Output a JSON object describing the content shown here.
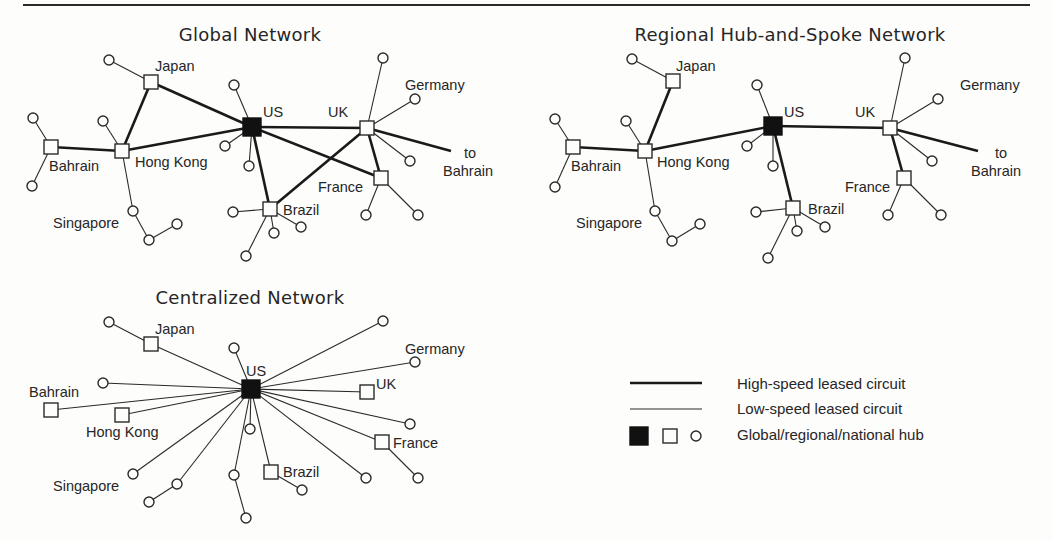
{
  "colors": {
    "ink": "#1a1a1a",
    "paper": "#fdfdfc",
    "global_hub": "#111111"
  },
  "diagrams": [
    {
      "id": "global",
      "title": "Global Network",
      "title_pos": [
        250,
        41
      ],
      "nodes": [
        {
          "id": "us",
          "type": "global",
          "x": 252,
          "y": 127,
          "label": "US",
          "lx": 263,
          "ly": 117
        },
        {
          "id": "japan",
          "type": "regional",
          "x": 151,
          "y": 82,
          "label": "Japan",
          "lx": 155,
          "ly": 71
        },
        {
          "id": "bahrain",
          "type": "regional",
          "x": 51,
          "y": 147,
          "label": "Bahrain",
          "lx": 49,
          "ly": 171
        },
        {
          "id": "hongkong",
          "type": "regional",
          "x": 122,
          "y": 151,
          "label": "Hong Kong",
          "lx": 135,
          "ly": 167
        },
        {
          "id": "uk",
          "type": "regional",
          "x": 367,
          "y": 128,
          "label": "UK",
          "lx": 328,
          "ly": 117
        },
        {
          "id": "france",
          "type": "regional",
          "x": 381,
          "y": 178,
          "label": "France",
          "lx": 318,
          "ly": 192
        },
        {
          "id": "brazil",
          "type": "regional",
          "x": 270,
          "y": 209,
          "label": "Brazil",
          "lx": 283,
          "ly": 215
        },
        {
          "id": "germany_lbl",
          "type": "label",
          "label": "Germany",
          "lx": 405,
          "ly": 90
        },
        {
          "id": "singapore_lbl",
          "type": "label",
          "label": "Singapore",
          "lx": 53,
          "ly": 228
        },
        {
          "id": "tobahrain_lbl",
          "type": "label",
          "label": "to",
          "lx": 464,
          "ly": 158
        },
        {
          "id": "tobahrain_lbl2",
          "type": "label",
          "label": "Bahrain",
          "lx": 443,
          "ly": 176
        }
      ],
      "high_speed": [
        [
          252,
          127,
          151,
          82
        ],
        [
          252,
          127,
          122,
          151
        ],
        [
          151,
          82,
          122,
          151
        ],
        [
          122,
          151,
          51,
          147
        ],
        [
          252,
          127,
          367,
          128
        ],
        [
          252,
          127,
          381,
          178
        ],
        [
          252,
          127,
          270,
          209
        ],
        [
          270,
          209,
          367,
          128
        ],
        [
          367,
          128,
          381,
          178
        ],
        [
          367,
          128,
          451,
          151
        ]
      ],
      "low_speed": [
        [
          151,
          82,
          109,
          60
        ],
        [
          51,
          147,
          33,
          118
        ],
        [
          51,
          147,
          32,
          186
        ],
        [
          122,
          151,
          103,
          121
        ],
        [
          122,
          151,
          133,
          211
        ],
        [
          133,
          211,
          149,
          240
        ],
        [
          149,
          240,
          177,
          224
        ],
        [
          252,
          127,
          234,
          85
        ],
        [
          252,
          127,
          225,
          146
        ],
        [
          252,
          127,
          249,
          166
        ],
        [
          270,
          209,
          233,
          212
        ],
        [
          270,
          209,
          274,
          233
        ],
        [
          270,
          209,
          301,
          227
        ],
        [
          270,
          209,
          246,
          256
        ],
        [
          367,
          128,
          383,
          58
        ],
        [
          367,
          128,
          415,
          99
        ],
        [
          367,
          128,
          410,
          161
        ],
        [
          381,
          178,
          366,
          215
        ],
        [
          381,
          178,
          418,
          215
        ]
      ],
      "circles": [
        [
          109,
          60
        ],
        [
          33,
          118
        ],
        [
          32,
          186
        ],
        [
          103,
          121
        ],
        [
          133,
          211
        ],
        [
          149,
          240
        ],
        [
          177,
          224
        ],
        [
          234,
          85
        ],
        [
          225,
          146
        ],
        [
          249,
          166
        ],
        [
          233,
          212
        ],
        [
          274,
          233
        ],
        [
          301,
          227
        ],
        [
          246,
          256
        ],
        [
          383,
          58
        ],
        [
          415,
          99
        ],
        [
          410,
          161
        ],
        [
          366,
          215
        ],
        [
          418,
          215
        ]
      ]
    },
    {
      "id": "regional",
      "title": "Regional Hub-and-Spoke Network",
      "title_pos": [
        790,
        41
      ],
      "nodes": [
        {
          "id": "us",
          "type": "global",
          "x": 773,
          "y": 126,
          "label": "US",
          "lx": 784,
          "ly": 117
        },
        {
          "id": "japan",
          "type": "regional",
          "x": 673,
          "y": 81,
          "label": "Japan",
          "lx": 676,
          "ly": 71
        },
        {
          "id": "bahrain",
          "type": "regional",
          "x": 573,
          "y": 147,
          "label": "Bahrain",
          "lx": 571,
          "ly": 171
        },
        {
          "id": "hongkong",
          "type": "regional",
          "x": 645,
          "y": 151,
          "label": "Hong Kong",
          "lx": 657,
          "ly": 167
        },
        {
          "id": "uk",
          "type": "regional",
          "x": 890,
          "y": 128,
          "label": "UK",
          "lx": 855,
          "ly": 117
        },
        {
          "id": "france",
          "type": "regional",
          "x": 904,
          "y": 178,
          "label": "France",
          "lx": 845,
          "ly": 192
        },
        {
          "id": "brazil",
          "type": "regional",
          "x": 793,
          "y": 208,
          "label": "Brazil",
          "lx": 808,
          "ly": 214
        },
        {
          "id": "germany_lbl",
          "type": "label",
          "label": "Germany",
          "lx": 960,
          "ly": 90
        },
        {
          "id": "singapore_lbl",
          "type": "label",
          "label": "Singapore",
          "lx": 576,
          "ly": 228
        },
        {
          "id": "tobahrain_lbl",
          "type": "label",
          "label": "to",
          "lx": 995,
          "ly": 158
        },
        {
          "id": "tobahrain_lbl2",
          "type": "label",
          "label": "Bahrain",
          "lx": 971,
          "ly": 176
        }
      ],
      "high_speed": [
        [
          673,
          81,
          645,
          151
        ],
        [
          645,
          151,
          573,
          147
        ],
        [
          645,
          151,
          773,
          126
        ],
        [
          773,
          126,
          890,
          128
        ],
        [
          773,
          126,
          793,
          208
        ],
        [
          890,
          128,
          904,
          178
        ],
        [
          890,
          128,
          978,
          151
        ]
      ],
      "low_speed": [
        [
          673,
          81,
          632,
          59
        ],
        [
          573,
          147,
          555,
          119
        ],
        [
          573,
          147,
          555,
          187
        ],
        [
          645,
          151,
          626,
          121
        ],
        [
          645,
          151,
          655,
          211
        ],
        [
          655,
          211,
          672,
          241
        ],
        [
          672,
          241,
          700,
          224
        ],
        [
          773,
          126,
          757,
          85
        ],
        [
          773,
          126,
          747,
          146
        ],
        [
          773,
          126,
          773,
          166
        ],
        [
          793,
          208,
          756,
          212
        ],
        [
          793,
          208,
          797,
          231
        ],
        [
          793,
          208,
          825,
          227
        ],
        [
          793,
          208,
          768,
          258
        ],
        [
          890,
          128,
          905,
          58
        ],
        [
          890,
          128,
          938,
          99
        ],
        [
          890,
          128,
          932,
          161
        ],
        [
          904,
          178,
          888,
          215
        ],
        [
          904,
          178,
          941,
          215
        ]
      ],
      "circles": [
        [
          632,
          59
        ],
        [
          555,
          119
        ],
        [
          555,
          187
        ],
        [
          626,
          121
        ],
        [
          655,
          211
        ],
        [
          672,
          241
        ],
        [
          700,
          224
        ],
        [
          757,
          85
        ],
        [
          747,
          146
        ],
        [
          773,
          166
        ],
        [
          756,
          212
        ],
        [
          797,
          231
        ],
        [
          825,
          227
        ],
        [
          768,
          258
        ],
        [
          905,
          58
        ],
        [
          938,
          99
        ],
        [
          932,
          161
        ],
        [
          888,
          215
        ],
        [
          941,
          215
        ]
      ]
    },
    {
      "id": "centralized",
      "title": "Centralized Network",
      "title_pos": [
        250,
        304
      ],
      "nodes": [
        {
          "id": "us",
          "type": "global",
          "x": 251,
          "y": 389,
          "label": "US",
          "lx": 246,
          "ly": 376
        },
        {
          "id": "japan",
          "type": "regional",
          "x": 151,
          "y": 344,
          "label": "Japan",
          "lx": 155,
          "ly": 334
        },
        {
          "id": "bahrain",
          "type": "regional",
          "x": 51,
          "y": 410,
          "label": "Bahrain",
          "lx": 29,
          "ly": 397
        },
        {
          "id": "hongkong",
          "type": "regional",
          "x": 122,
          "y": 415,
          "label": "Hong Kong",
          "lx": 86,
          "ly": 437
        },
        {
          "id": "uk",
          "type": "regional",
          "x": 367,
          "y": 392,
          "label": "UK",
          "lx": 376,
          "ly": 389
        },
        {
          "id": "france",
          "type": "regional",
          "x": 382,
          "y": 442,
          "label": "France",
          "lx": 393,
          "ly": 448
        },
        {
          "id": "brazil",
          "type": "regional",
          "x": 271,
          "y": 472,
          "label": "Brazil",
          "lx": 283,
          "ly": 477
        },
        {
          "id": "germany_lbl",
          "type": "label",
          "label": "Germany",
          "lx": 405,
          "ly": 354
        },
        {
          "id": "singapore_lbl",
          "type": "label",
          "label": "Singapore",
          "lx": 53,
          "ly": 491
        }
      ],
      "high_speed": [],
      "low_speed": [
        [
          251,
          389,
          151,
          344
        ],
        [
          151,
          344,
          109,
          322
        ],
        [
          251,
          389,
          103,
          383
        ],
        [
          251,
          389,
          51,
          410
        ],
        [
          251,
          389,
          122,
          415
        ],
        [
          251,
          389,
          234,
          348
        ],
        [
          251,
          389,
          383,
          321
        ],
        [
          251,
          389,
          415,
          362
        ],
        [
          251,
          389,
          367,
          392
        ],
        [
          251,
          389,
          410,
          424
        ],
        [
          251,
          389,
          382,
          442
        ],
        [
          382,
          442,
          418,
          478
        ],
        [
          251,
          389,
          366,
          478
        ],
        [
          251,
          389,
          271,
          472
        ],
        [
          271,
          472,
          302,
          490
        ],
        [
          251,
          389,
          250,
          429
        ],
        [
          251,
          389,
          234,
          475
        ],
        [
          234,
          475,
          246,
          518
        ],
        [
          251,
          389,
          133,
          474
        ],
        [
          251,
          389,
          177,
          484
        ],
        [
          177,
          484,
          149,
          502
        ]
      ],
      "circles": [
        [
          109,
          322
        ],
        [
          103,
          383
        ],
        [
          234,
          348
        ],
        [
          383,
          321
        ],
        [
          415,
          362
        ],
        [
          410,
          424
        ],
        [
          418,
          478
        ],
        [
          366,
          478
        ],
        [
          302,
          490
        ],
        [
          250,
          429
        ],
        [
          234,
          475
        ],
        [
          246,
          518
        ],
        [
          133,
          474
        ],
        [
          177,
          484
        ],
        [
          149,
          502
        ]
      ]
    }
  ],
  "legend": {
    "items": [
      {
        "symbol": "thick-line",
        "label": "High-speed leased circuit"
      },
      {
        "symbol": "thin-line",
        "label": "Low-speed leased circuit"
      },
      {
        "symbol": "hub-symbols",
        "label": "Global/regional/national hub"
      }
    ]
  }
}
